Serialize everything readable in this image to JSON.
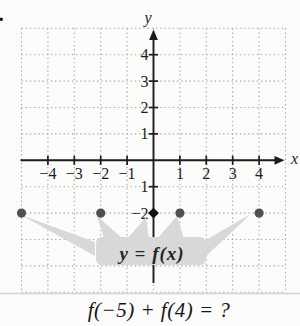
{
  "problem_number": "2.",
  "question": "f(−5) + f(4) = ?",
  "graph": {
    "y_axis_label": "y",
    "x_axis_label": "x",
    "callout_label": "y = f(x)",
    "x_ticks": [
      {
        "v": -4,
        "label": "−4"
      },
      {
        "v": -3,
        "label": "−3"
      },
      {
        "v": -2,
        "label": "−2"
      },
      {
        "v": -1,
        "label": "−1"
      },
      {
        "v": 1,
        "label": "1"
      },
      {
        "v": 2,
        "label": "2"
      },
      {
        "v": 3,
        "label": "3"
      },
      {
        "v": 4,
        "label": "4"
      }
    ],
    "y_ticks": [
      {
        "v": 4,
        "label": "4"
      },
      {
        "v": 3,
        "label": "3"
      },
      {
        "v": 2,
        "label": "2"
      },
      {
        "v": 1,
        "label": "1"
      },
      {
        "v": -1,
        "label": "1"
      },
      {
        "v": -2,
        "label": "−2"
      }
    ],
    "colors": {
      "axis": "#1c1c1c",
      "grid": "#a8a8a8",
      "point_gray": "#505050",
      "point_black": "#111111",
      "callout_bg": "#d8d8d8",
      "separator": "#d2d2d2"
    }
  },
  "chart_data": {
    "type": "scatter",
    "title": "y = f(x)",
    "xlabel": "x",
    "ylabel": "y",
    "xlim": [
      -5,
      5
    ],
    "ylim": [
      -5,
      5
    ],
    "grid": true,
    "points": [
      {
        "x": -5,
        "y": -2,
        "marker": "circle-gray"
      },
      {
        "x": -2,
        "y": -2,
        "marker": "circle-gray"
      },
      {
        "x": 0,
        "y": -2,
        "marker": "diamond-black"
      },
      {
        "x": 1,
        "y": -2,
        "marker": "circle-gray"
      },
      {
        "x": 4,
        "y": -2,
        "marker": "circle-gray"
      }
    ],
    "annotation": "f(−5) + f(4) = ?"
  }
}
